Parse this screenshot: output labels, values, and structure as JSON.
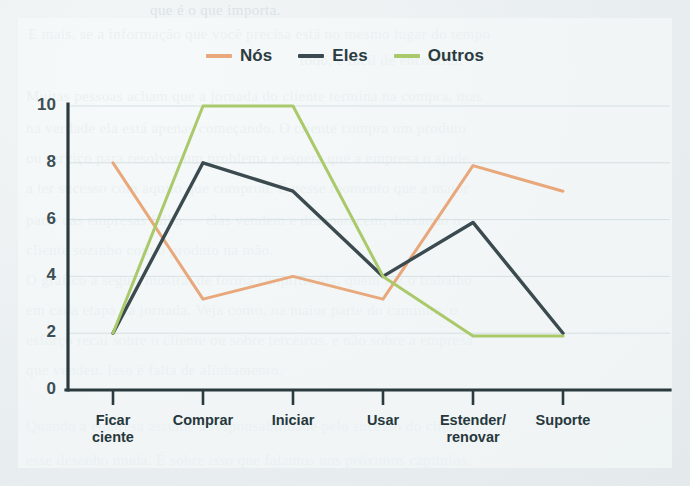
{
  "page": {
    "background_color": "#e9eef0",
    "ghost_lines": [
      "que é o que importa.",
      "E mais, se a informação que você precisa está no mesmo lugar do tempo",
      "todo, é fácil de encontrar.",
      "Muitas pessoas acham que a jornada do cliente termina na compra, mas",
      "na verdade ela está apenas começando. O cliente compra um produto",
      "ou serviço para resolver um problema e espera que a empresa o ajude",
      "a ter sucesso com aquilo que comprou. É nesse momento que a maior",
      "parte das empresas falha — elas vendem e desaparecem, deixando o",
      "cliente sozinho com o produto na mão.",
      "O gráfico a seguir mostra, de forma simplificada, quem faz o trabalho",
      "em cada etapa da jornada. Veja como, na maior parte do caminho, o",
      "esforço recai sobre o cliente ou sobre terceiros, e não sobre a empresa",
      "que vendeu. Isso é falta de alinhamento.",
      "Quando a empresa assume a responsabilidade pelo sucesso do cliente,",
      "esse desenho muda. É sobre isso que falamos nos próximos capítulos."
    ]
  },
  "chart_data": {
    "type": "line",
    "title": "",
    "subtitle": "",
    "xlabel": "",
    "ylabel": "",
    "categories": [
      "Ficar\nciente",
      "Comprar",
      "Iniciar",
      "Usar",
      "Estender/\nrenovar",
      "Suporte"
    ],
    "category_labels_flat": [
      "Ficar ciente",
      "Comprar",
      "Iniciar",
      "Usar",
      "Estender/renovar",
      "Suporte"
    ],
    "ylim": [
      0,
      10
    ],
    "yticks": [
      0,
      2,
      4,
      6,
      8,
      10
    ],
    "ytick_labels": [
      "0",
      "2",
      "4",
      "6",
      "8",
      "10"
    ],
    "grid": true,
    "grid_axis": "y",
    "legend_position": "top-center",
    "series": [
      {
        "name": "Nós",
        "color": "#e8a87c",
        "values": [
          8,
          3.2,
          4,
          3.2,
          7.9,
          7
        ]
      },
      {
        "name": "Eles",
        "color": "#3a4a4f",
        "values": [
          2,
          8,
          7,
          4,
          5.9,
          2
        ]
      },
      {
        "name": "Outros",
        "color": "#aac96a",
        "values": [
          2,
          10,
          10,
          4,
          1.9,
          1.9
        ]
      }
    ]
  },
  "axis_style": {
    "spine_color": "#2a3a3f",
    "grid_color": "#d7e0e2",
    "tick_color": "#2a3a3f",
    "label_color": "#27383d"
  }
}
